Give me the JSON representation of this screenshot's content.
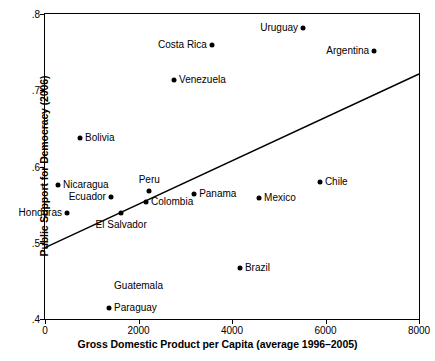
{
  "chart_data": {
    "type": "scatter",
    "title": "",
    "xlabel": "Gross Domestic Product per Capita (average 1996–2005)",
    "ylabel": "Public Support for Democracy (2006)",
    "xlim": [
      0,
      8000
    ],
    "ylim": [
      0.4,
      0.8
    ],
    "xticks": [
      "0",
      "2000",
      "4000",
      "6000",
      "8000"
    ],
    "xtick_values": [
      0,
      2000,
      4000,
      6000,
      8000
    ],
    "yticks": [
      ".8",
      ".7",
      ".6",
      ".5",
      ".4"
    ],
    "ytick_values": [
      0.8,
      0.7,
      0.6,
      0.5,
      0.4
    ],
    "grid": false,
    "legend": "none",
    "points": [
      {
        "label": "Uruguay",
        "x": 5520,
        "y": 0.782,
        "label_pos": "left"
      },
      {
        "label": "Costa Rica",
        "x": 3570,
        "y": 0.759,
        "label_pos": "left"
      },
      {
        "label": "Argentina",
        "x": 7040,
        "y": 0.751,
        "label_pos": "left"
      },
      {
        "label": "Venezuela",
        "x": 2760,
        "y": 0.713,
        "label_pos": "right"
      },
      {
        "label": "Bolivia",
        "x": 750,
        "y": 0.637,
        "label_pos": "right"
      },
      {
        "label": "Chile",
        "x": 5880,
        "y": 0.58,
        "label_pos": "right"
      },
      {
        "label": "Nicaragua",
        "x": 280,
        "y": 0.576,
        "label_pos": "right"
      },
      {
        "label": "Peru",
        "x": 2230,
        "y": 0.568,
        "label_pos": "above"
      },
      {
        "label": "Panama",
        "x": 3190,
        "y": 0.564,
        "label_pos": "right"
      },
      {
        "label": "Ecuador",
        "x": 1410,
        "y": 0.56,
        "label_pos": "left"
      },
      {
        "label": "Mexico",
        "x": 4580,
        "y": 0.559,
        "label_pos": "right"
      },
      {
        "label": "Colombia",
        "x": 2160,
        "y": 0.553,
        "label_pos": "right"
      },
      {
        "label": "El Salvador",
        "x": 1630,
        "y": 0.539,
        "label_pos": "below"
      },
      {
        "label": "Honduras",
        "x": 470,
        "y": 0.539,
        "label_pos": "left"
      },
      {
        "label": "Brazil",
        "x": 4170,
        "y": 0.467,
        "label_pos": "right"
      },
      {
        "label": "Guatemala",
        "x": 1370,
        "y": 0.429,
        "label_pos": "above-right"
      },
      {
        "label": "Paraguay",
        "x": 1370,
        "y": 0.414,
        "label_pos": "right"
      }
    ],
    "trendline": {
      "x0": 0,
      "y0": 0.4937,
      "x1": 8000,
      "y1": 0.7213
    }
  }
}
